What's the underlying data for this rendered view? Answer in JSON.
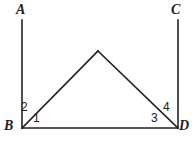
{
  "figure": {
    "type": "geometry-diagram",
    "background_color": "#ffffff",
    "stroke_color": "#222222",
    "stroke_width": 1.6,
    "width": 192,
    "height": 143
  },
  "vertex_labels": {
    "a": "A",
    "b": "B",
    "c": "C",
    "d": "D"
  },
  "angle_labels": {
    "one": "1",
    "two": "2",
    "three": "3",
    "four": "4"
  },
  "chart_data": {
    "type": "diagram",
    "title": "",
    "points": {
      "A": [
        22,
        20
      ],
      "B": [
        22,
        128
      ],
      "C": [
        178,
        20
      ],
      "D": [
        178,
        128
      ],
      "apex": [
        98,
        51
      ]
    },
    "segments": [
      {
        "name": "BA",
        "from": "B",
        "to": "A"
      },
      {
        "name": "DC",
        "from": "D",
        "to": "C"
      },
      {
        "name": "BD",
        "from": "B",
        "to": "D"
      },
      {
        "name": "B-apex",
        "from": "B",
        "to": "apex"
      },
      {
        "name": "apex-D",
        "from": "apex",
        "to": "D"
      }
    ],
    "angles": [
      {
        "label": "1",
        "at": "B",
        "between": [
          "BD",
          "B-apex"
        ]
      },
      {
        "label": "2",
        "at": "B",
        "between": [
          "B-apex",
          "BA"
        ]
      },
      {
        "label": "3",
        "at": "D",
        "between": [
          "BD",
          "apex-D"
        ]
      },
      {
        "label": "4",
        "at": "D",
        "between": [
          "apex-D",
          "DC"
        ]
      }
    ]
  }
}
